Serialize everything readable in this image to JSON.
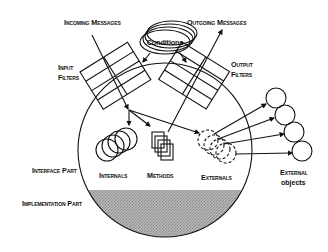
{
  "diagram": {
    "labels": {
      "incoming_messages": "Incoming Messages",
      "outgoing_messages": "Outgoing Messages",
      "conditions": "Conditions",
      "input_filters_line1": "Input",
      "input_filters_line2": "Filters",
      "output_filters_line1": "Output",
      "output_filters_line2": "Filters",
      "interface_part": "Interface Part",
      "implementation_part": "Implementation Part",
      "internals": "Internals",
      "methods": "Methods",
      "externals": "Externals",
      "external_objects_line1": "External",
      "external_objects_line2": "objects"
    },
    "colors": {
      "ink": "#111111",
      "implementation_shading": "#a8a8a8",
      "conditions_fill": "#c8c8c8",
      "background": "#ffffff"
    },
    "external_object_count": 4,
    "filter_rows": 4
  }
}
